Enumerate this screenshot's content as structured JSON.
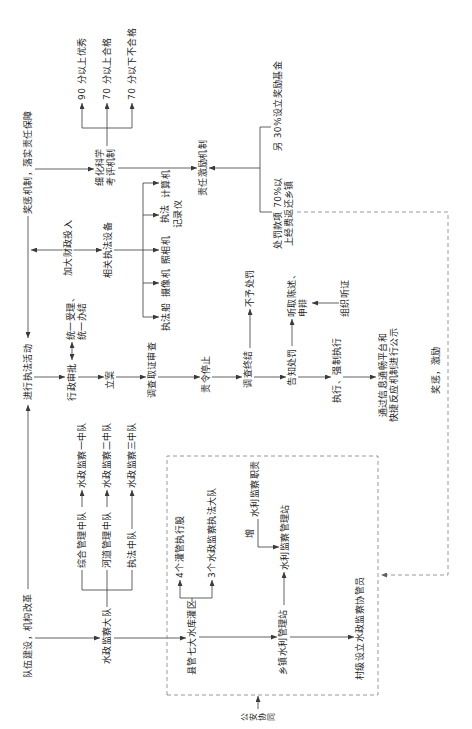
{
  "diagram": {
    "top_row": {
      "team_building": "队伍建设，机构改革",
      "enforcement_activity": "进行执法活动",
      "reward_mechanism": "奖惩机制，落实责任保障"
    },
    "brigade": {
      "label": "水政监察大队",
      "squads": [
        {
          "name": "综合管理中队",
          "target": "水政监察一中队"
        },
        {
          "name": "河道管理中队",
          "target": "水政监察二中队"
        },
        {
          "name": "执法中队",
          "target": "水政监察三中队"
        }
      ]
    },
    "county_box": {
      "reservoir_district": "县管七大水库灌区",
      "sub_units": [
        "4个灌管执行股",
        "3个水政监察执法大队"
      ],
      "township_station": "乡镇水利管理站",
      "add_label": "增",
      "supervision_duty": "水利监察职责",
      "supervision_station": "水利监察管理站",
      "village_assistant": "村级设立水政监察协管员"
    },
    "police_coordination": [
      "公",
      "安",
      "协",
      "同"
    ],
    "procedure": {
      "administrative_approval": "行政审批",
      "unified_handling": [
        "统一受理、",
        "统一办结"
      ],
      "case_filing": "立案",
      "investigation": "调查取证审查",
      "order_to_stop": "责令停止",
      "investigation_end": "调查终结",
      "no_penalty": "不予处罚",
      "penalty_notice": "告知处罚",
      "statement_defense": [
        "听取陈述、",
        "申辩"
      ],
      "hearing": "组织听证",
      "enforcement": "执行、强制执行",
      "publicity": [
        "通过信息通畅平台和",
        "快捷反应机制进行公示"
      ]
    },
    "funding": {
      "label": "加大财政投入",
      "equipment": "相关执法设备",
      "items": [
        "执法船",
        "摄像机",
        "照相机",
        [
          "执法",
          "记录仪"
        ],
        "计算机"
      ]
    },
    "evaluation": {
      "label": [
        "细化科学",
        "考评机制"
      ],
      "grades": [
        "90 分以上优秀",
        "70 分以上合格",
        "70 分以下不合格"
      ]
    },
    "incentive": {
      "label": "责任激励机制",
      "reward_fund": "另 30%设立奖励基金",
      "fine_return": [
        "处罚款项 70%以",
        "上经费返还乡镇"
      ],
      "feedback_label": "奖惩，激励"
    },
    "colors": {
      "line": "#3a3a3a",
      "dashed_line": "#808080",
      "text": "#1e1e1e",
      "background": "#ffffff"
    }
  }
}
